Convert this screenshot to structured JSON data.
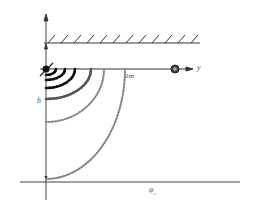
{
  "diagram": {
    "labels": {
      "y_axis": "y",
      "distance": "2m",
      "height": "h",
      "phi": "φ",
      "phi_sub": "s"
    },
    "colors": {
      "axis": "#333333",
      "curve_dark": "#111111",
      "curve_mid": "#555555",
      "curve_light": "#888888",
      "marker": "#222222"
    },
    "curves": [
      {
        "rx": 10,
        "ry": 6,
        "tone": "dark"
      },
      {
        "rx": 19,
        "ry": 11,
        "tone": "dark"
      },
      {
        "rx": 29,
        "ry": 19,
        "tone": "dark"
      },
      {
        "rx": 45,
        "ry": 30,
        "tone": "dark"
      },
      {
        "rx": 58,
        "ry": 53,
        "tone": "light"
      },
      {
        "rx": 79,
        "ry": 110,
        "tone": "light"
      }
    ]
  }
}
